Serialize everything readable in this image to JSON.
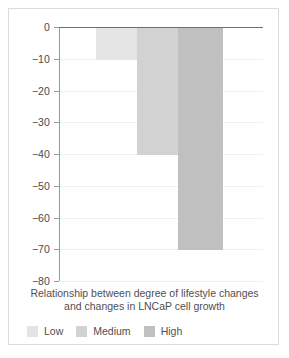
{
  "chart_data": {
    "type": "bar",
    "title": "",
    "caption_lines": [
      "Relationship between degree of lifestyle changes",
      "and changes in LNCaP cell growth"
    ],
    "categories": [
      "Low",
      "Medium",
      "High"
    ],
    "values": [
      -10,
      -40,
      -70
    ],
    "xlabel": "",
    "ylabel": "",
    "ylim": [
      -80,
      0
    ],
    "ytick_labels": [
      "0",
      "−10",
      "−20",
      "−30",
      "−40",
      "−50",
      "−60",
      "−70",
      "−80"
    ],
    "ytick_values": [
      0,
      -10,
      -20,
      -30,
      -40,
      -50,
      -60,
      -70,
      -80
    ],
    "grid": true,
    "legend_position": "bottom-left",
    "legend": [
      {
        "label": "Low",
        "color": "#e4e4e4"
      },
      {
        "label": "Medium",
        "color": "#d2d2d2"
      },
      {
        "label": "High",
        "color": "#c0c0c0"
      }
    ],
    "colors": {
      "axis": "#6e6e6e",
      "gridline": "#f0f0f0",
      "text": "#4f4f4f",
      "frame": "#dcdcdc",
      "background": "#ffffff"
    }
  }
}
